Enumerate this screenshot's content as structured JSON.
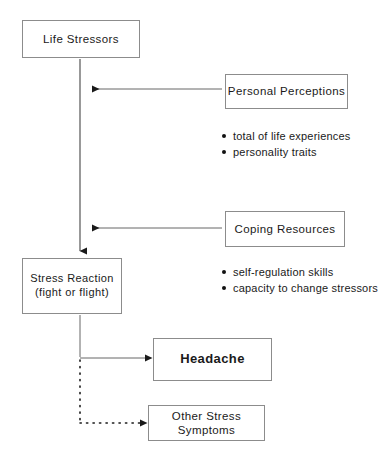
{
  "diagram": {
    "nodes": {
      "life_stressors": {
        "label": "Life Stressors"
      },
      "personal_perceptions": {
        "label": "Personal Perceptions"
      },
      "coping_resources": {
        "label": "Coping Resources"
      },
      "stress_reaction": {
        "label": "Stress Reaction\n(fight or flight)"
      },
      "headache": {
        "label": "Headache"
      },
      "other_stress_symptoms": {
        "label": "Other Stress Symptoms"
      }
    },
    "bullets": {
      "personal_perceptions": [
        "total of life experiences",
        "personality traits"
      ],
      "coping_resources": [
        "self-regulation skills",
        "capacity to change stressors"
      ]
    },
    "connectors": [
      {
        "id": "life-stressors-to-stress-reaction",
        "style": "solid",
        "direction": "down"
      },
      {
        "id": "personal-perceptions-to-main-flow",
        "style": "solid",
        "direction": "left"
      },
      {
        "id": "coping-resources-to-main-flow",
        "style": "solid",
        "direction": "left"
      },
      {
        "id": "stress-reaction-to-headache",
        "style": "solid",
        "direction": "right"
      },
      {
        "id": "stress-reaction-to-other-symptoms",
        "style": "dotted",
        "direction": "right"
      }
    ],
    "colors": {
      "box_border": "#8c8c8c",
      "line": "#444444",
      "text": "#1a1a1a",
      "background": "#ffffff"
    }
  }
}
